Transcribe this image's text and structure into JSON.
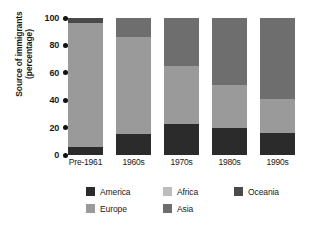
{
  "chart_data": {
    "type": "bar",
    "variant": "stacked-100-percent",
    "title": "",
    "xlabel": "",
    "ylabel": "Source of immigrants (percentage)",
    "categories": [
      "Pre-1961",
      "1960s",
      "1970s",
      "1980s",
      "1990s"
    ],
    "ylim": [
      0,
      100
    ],
    "yticks": [
      0,
      20,
      40,
      60,
      80,
      100
    ],
    "ytick_labels": [
      "0",
      "20",
      "40",
      "60",
      "80",
      "100"
    ],
    "grid": false,
    "legend_position": "bottom",
    "series": [
      {
        "name": "America",
        "color": "#2b2b2b",
        "values": [
          6,
          15,
          23,
          20,
          16
        ]
      },
      {
        "name": "Europe",
        "color": "#9a9a9a",
        "values": [
          90,
          71,
          42,
          31,
          25
        ]
      },
      {
        "name": "Africa",
        "color": "#bdbdbd",
        "values": [
          0,
          0,
          0,
          0,
          0
        ]
      },
      {
        "name": "Asia",
        "color": "#6e6e6e",
        "values": [
          0,
          14,
          35,
          49,
          59
        ]
      },
      {
        "name": "Oceania",
        "color": "#4a4a4a",
        "values": [
          4,
          0,
          0,
          0,
          0
        ]
      }
    ]
  },
  "axis": {
    "y_title_line1": "Source of immigrants",
    "y_title_line2": "(percentage)"
  },
  "legend": {
    "items": [
      {
        "label": "America",
        "color": "#2b2b2b"
      },
      {
        "label": "Africa",
        "color": "#bdbdbd"
      },
      {
        "label": "Oceania",
        "color": "#4a4a4a"
      },
      {
        "label": "Europe",
        "color": "#9a9a9a"
      },
      {
        "label": "Asia",
        "color": "#6e6e6e"
      }
    ]
  }
}
